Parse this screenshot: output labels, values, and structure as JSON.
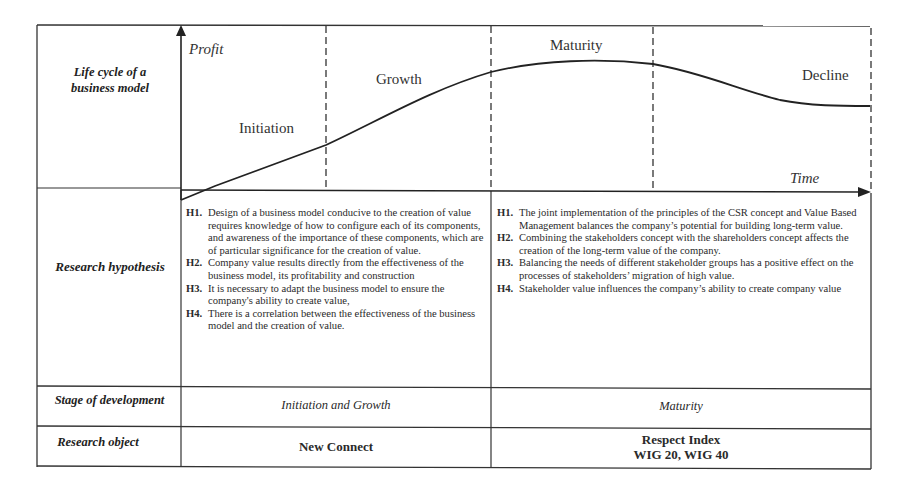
{
  "row_labels": {
    "life_cycle": [
      "Life cycle of a",
      "business model"
    ],
    "hypothesis": "Research hypothesis",
    "stage": "Stage of development",
    "object": "Research object"
  },
  "chart": {
    "y_axis_label": "Profit",
    "x_axis_label": "Time",
    "stages": [
      "Initiation",
      "Growth",
      "Maturity",
      "Decline"
    ]
  },
  "hypotheses": {
    "left": [
      {
        "id": "H1.",
        "text": "Design of a business model conducive to the creation of value requires knowledge of how to configure each of its components, and awareness of the importance of these components, which are of particular significance for the creation of value."
      },
      {
        "id": "H2.",
        "text": "Company value results directly from the effectiveness of the business model, its profitability and construction"
      },
      {
        "id": "H3.",
        "text": "It is necessary to adapt the business model to ensure the company's ability to create value,"
      },
      {
        "id": "H4.",
        "text": "There is a correlation between the effectiveness of the business model and the creation of value."
      }
    ],
    "right": [
      {
        "id": "H1.",
        "text": "The joint implementation of the principles of the CSR concept and Value Based Management balances the company’s potential for building long-term value."
      },
      {
        "id": "H2.",
        "text": "Combining the stakeholders concept with the shareholders concept affects the creation of the long-term value of the company."
      },
      {
        "id": "H3.",
        "text": "Balancing the needs of different stakeholder groups has a positive effect on the processes of stakeholders’ migration of high value."
      },
      {
        "id": "H4.",
        "text": "Stakeholder value influences the company’s ability to create company value"
      }
    ]
  },
  "stage_of_development": {
    "left": "Initiation and Growth",
    "right": "Maturity"
  },
  "research_object": {
    "left": "New Connect",
    "right_line1": "Respect Index",
    "right_line2": "WIG 20, WIG 40"
  }
}
